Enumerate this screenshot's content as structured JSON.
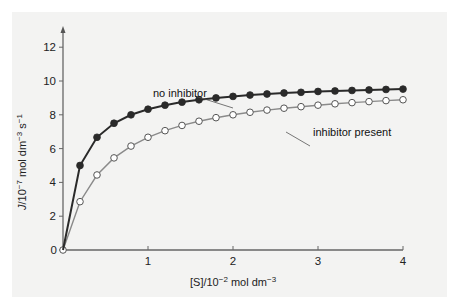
{
  "chart_data": {
    "type": "line",
    "title": "",
    "xlabel": "[S]/10^-2 mol dm^-3",
    "ylabel": "J/10^-7 mol dm^-3 s^-1",
    "xlim": [
      0,
      4
    ],
    "ylim": [
      0,
      13
    ],
    "xticks": [
      1,
      2,
      3,
      4
    ],
    "yticks": [
      0,
      2,
      4,
      6,
      8,
      10,
      12
    ],
    "grid": false,
    "legend": "annotations",
    "x": [
      0,
      0.2,
      0.4,
      0.6,
      0.8,
      1.0,
      1.2,
      1.4,
      1.6,
      1.8,
      2.0,
      2.2,
      2.4,
      2.6,
      2.8,
      3.0,
      3.2,
      3.4,
      3.6,
      3.8,
      4.0
    ],
    "series": [
      {
        "name": "no inhibitor",
        "marker": "filled-circle",
        "color": "#222222",
        "values": [
          0,
          5.0,
          6.67,
          7.5,
          8.0,
          8.33,
          8.57,
          8.75,
          8.89,
          9.0,
          9.09,
          9.17,
          9.23,
          9.29,
          9.33,
          9.38,
          9.41,
          9.44,
          9.47,
          9.5,
          9.52
        ]
      },
      {
        "name": "inhibitor present",
        "marker": "open-circle",
        "color": "#888888",
        "values": [
          0,
          2.86,
          4.44,
          5.45,
          6.15,
          6.67,
          7.06,
          7.37,
          7.62,
          7.83,
          8.0,
          8.15,
          8.28,
          8.39,
          8.48,
          8.57,
          8.65,
          8.72,
          8.78,
          8.84,
          8.89
        ]
      }
    ],
    "annotations": [
      {
        "text": "no inhibitor",
        "points_to": {
          "series": "no inhibitor",
          "x": 2.0
        }
      },
      {
        "text": "inhibitor present",
        "points_to": {
          "series": "inhibitor present",
          "x": 2.6
        }
      }
    ]
  },
  "labels": {
    "x_axis_title_main": "[S]/10",
    "x_axis_title_exp": "−2",
    "x_axis_title_unit": " mol dm",
    "x_axis_title_unit_exp": "−3",
    "y_axis_title_main": "J",
    "y_axis_title_rest": "/10",
    "y_axis_title_exp": "−7",
    "y_axis_title_unit": " mol dm",
    "y_axis_title_unit_exp": "−3",
    "y_axis_title_s": " s",
    "y_axis_title_s_exp": "−1",
    "annotation_no_inhibitor": "no inhibitor",
    "annotation_inhibitor": "inhibitor present"
  }
}
